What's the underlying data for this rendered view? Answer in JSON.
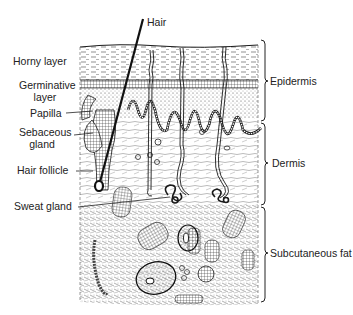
{
  "figure": {
    "labels_left": {
      "horny_layer": "Horny layer",
      "germinative_layer_1": "Germinative",
      "germinative_layer_2": "layer",
      "papilla": "Papilla",
      "sebaceous_gland_1": "Sebaceous",
      "sebaceous_gland_2": "gland",
      "hair_follicle": "Hair follicle",
      "sweat_gland": "Sweat gland"
    },
    "label_top": {
      "hair": "Hair"
    },
    "labels_right": {
      "epidermis": "Epidermis",
      "dermis": "Dermis",
      "subcutaneous_fat": "Subcutaneous fat"
    },
    "colors": {
      "ink": "#1a1a1a",
      "background": "#ffffff"
    }
  }
}
